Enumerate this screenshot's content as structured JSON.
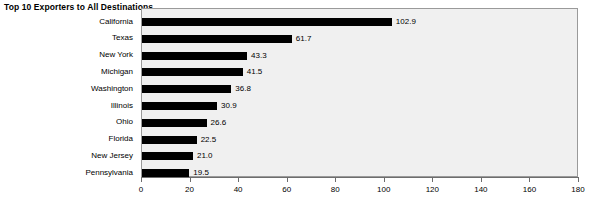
{
  "chart_data": {
    "type": "bar",
    "orientation": "horizontal",
    "title": "Top 10 Exporters to All Destinations",
    "xlabel": "",
    "ylabel": "",
    "xlim": [
      0,
      180
    ],
    "xticks": [
      0,
      20,
      40,
      60,
      80,
      100,
      120,
      140,
      160,
      180
    ],
    "grid": false,
    "legend": null,
    "bar_color": "#000000",
    "plot_background": "#f0f0f0",
    "categories": [
      "California",
      "Texas",
      "New York",
      "Michigan",
      "Washington",
      "Illinois",
      "Ohio",
      "Florida",
      "New Jersey",
      "Pennsylvania"
    ],
    "values": [
      102.9,
      61.7,
      43.3,
      41.5,
      36.8,
      30.9,
      26.6,
      22.5,
      21.0,
      19.5
    ],
    "value_labels": [
      "102.9",
      "61.7",
      "43.3",
      "41.5",
      "36.8",
      "30.9",
      "26.6",
      "22.5",
      "21.0",
      "19.5"
    ]
  }
}
